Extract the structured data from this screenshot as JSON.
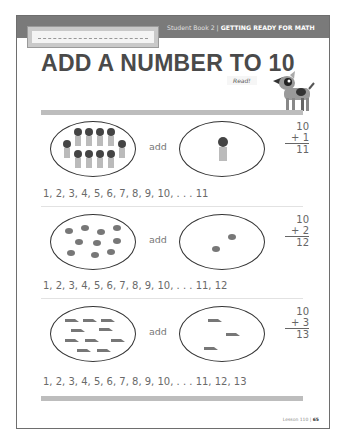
{
  "header": {
    "name_field_placeholder": "",
    "book_label": "Student Book 2 |",
    "section_title": "GETTING READY FOR MATH"
  },
  "page_title": "ADD A NUMBER TO 10",
  "read_badge": "Read!",
  "mascot": "dog-icon",
  "problems": [
    {
      "object_icon": "person-icon",
      "left_count": 10,
      "right_count": 1,
      "connector": "add",
      "addend_top": "10",
      "addend_bottom": "+ 1",
      "sum": "11",
      "counting_sequence": "1, 2, 3, 4, 5, 6, 7, 8, 9, 10, . . . 11"
    },
    {
      "object_icon": "snail-icon",
      "left_count": 10,
      "right_count": 2,
      "connector": "add",
      "addend_top": "10",
      "addend_bottom": "+ 2",
      "sum": "12",
      "counting_sequence": "1, 2, 3, 4, 5, 6, 7, 8, 9, 10, . . . 11, 12"
    },
    {
      "object_icon": "shoe-icon",
      "left_count": 10,
      "right_count": 3,
      "connector": "add",
      "addend_top": "10",
      "addend_bottom": "+ 3",
      "sum": "13",
      "counting_sequence": "1, 2, 3, 4, 5, 6, 7, 8, 9, 10, . . . 11, 12, 13"
    }
  ],
  "footer": {
    "lesson": "Lesson 110 |",
    "page_number": "65"
  },
  "colors": {
    "header_bar": "#7a7a7a",
    "title": "#4a4a4a",
    "divider": "#bdbdbd",
    "icon_fill": "#777777"
  }
}
